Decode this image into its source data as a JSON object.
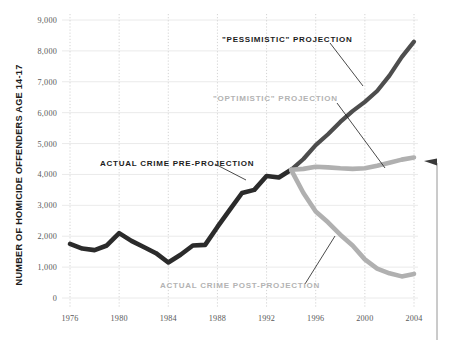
{
  "chart_data": {
    "type": "line",
    "title": "",
    "xlabel": "",
    "ylabel": "NUMBER OF HOMICIDE OFFENDERS AGE 14-17",
    "xlim": [
      1976,
      2004
    ],
    "ylim": [
      0,
      9000
    ],
    "grid": true,
    "legend_position": "inline-annotations",
    "y_ticks": [
      "0",
      "1,000",
      "2,000",
      "3,000",
      "4,000",
      "5,000",
      "6,000",
      "7,000",
      "8,000",
      "9,000"
    ],
    "y_tick_values": [
      0,
      1000,
      2000,
      3000,
      4000,
      5000,
      6000,
      7000,
      8000,
      9000
    ],
    "x_ticks": [
      "1976",
      "1980",
      "1984",
      "1988",
      "1992",
      "1996",
      "2000",
      "2004"
    ],
    "x_tick_values": [
      1976,
      1980,
      1984,
      1988,
      1992,
      1996,
      2000,
      2004
    ],
    "series": [
      {
        "name": "ACTUAL CRIME PRE-PROJECTION",
        "color": "#2b2b2b",
        "x": [
          1976,
          1977,
          1978,
          1979,
          1980,
          1981,
          1982,
          1983,
          1984,
          1985,
          1986,
          1987,
          1988,
          1989,
          1990,
          1991,
          1992,
          1993,
          1994
        ],
        "values": [
          1750,
          1600,
          1550,
          1700,
          2100,
          1850,
          1650,
          1450,
          1150,
          1400,
          1700,
          1720,
          2300,
          2850,
          3400,
          3500,
          3950,
          3900,
          4150
        ]
      },
      {
        "name": "\"PESSIMISTIC\" PROJECTION",
        "color": "#4d4d4d",
        "x": [
          1994,
          1995,
          1996,
          1997,
          1998,
          1999,
          2000,
          2001,
          2002,
          2003,
          2004
        ],
        "values": [
          4150,
          4500,
          4950,
          5300,
          5700,
          6050,
          6350,
          6700,
          7200,
          7800,
          8300
        ]
      },
      {
        "name": "\"OPTIMISTIC\" PROJECTION",
        "color": "#b0b0b0",
        "x": [
          1994,
          1995,
          1996,
          1997,
          1998,
          1999,
          2000,
          2001,
          2002,
          2003,
          2004
        ],
        "values": [
          4150,
          4180,
          4250,
          4230,
          4200,
          4180,
          4200,
          4280,
          4380,
          4480,
          4550
        ]
      },
      {
        "name": "ACTUAL CRIME POST-PROJECTION",
        "color": "#b0b0b0",
        "x": [
          1994,
          1995,
          1996,
          1997,
          1998,
          1999,
          2000,
          2001,
          2002,
          2003,
          2004
        ],
        "values": [
          4150,
          3400,
          2800,
          2450,
          2050,
          1700,
          1250,
          950,
          800,
          700,
          780
        ]
      }
    ],
    "annotations": [
      {
        "text": "\"PESSIMISTIC\" PROJECTION",
        "style": "dark"
      },
      {
        "text": "\"OPTIMISTIC\" PROJECTION",
        "style": "light"
      },
      {
        "text": "ACTUAL CRIME PRE-PROJECTION",
        "style": "dark"
      },
      {
        "text": "ACTUAL CRIME POST-PROJECTION",
        "style": "light"
      }
    ],
    "colors": {
      "actual_pre": "#2b2b2b",
      "pessimistic": "#4d4d4d",
      "optimistic": "#b0b0b0",
      "actual_post": "#b0b0b0",
      "gridline_horizontal": "#e4e4e4",
      "gridline_vertical": "#c9c9c9",
      "tick_text": "#5a5a5a",
      "axis_title": "#1c1c1c",
      "background": "#ffffff"
    },
    "marker": {
      "name": "right-edge-callout-arrow",
      "description": "vertical rule with left-pointing arrowhead at right margin"
    }
  }
}
